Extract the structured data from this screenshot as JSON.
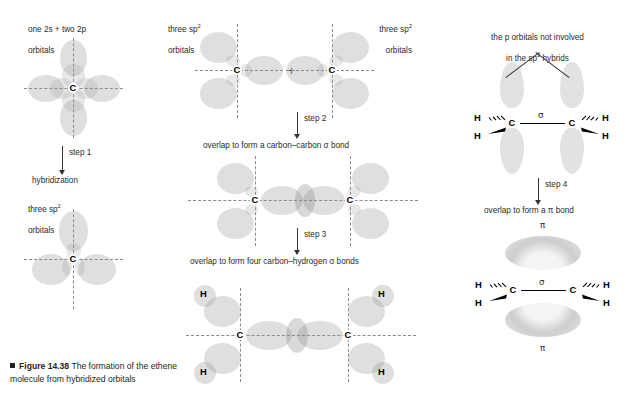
{
  "figure": {
    "number": "Figure 14.38",
    "caption_rest": "The formation of the ethene molecule from hybridized orbitals",
    "caption_full": "Figure 14.38 The formation of the ethene molecule from hybridized orbitals"
  },
  "column_left": {
    "label_top_line1": "one 2s + two 2p",
    "label_top_line2": "orbitals",
    "step": {
      "name": "step 1",
      "action": "hybridization"
    },
    "label_bottom_line1": "three sp",
    "label_bottom_sup": "2",
    "label_bottom_line2": "orbitals",
    "atom_label": "C"
  },
  "column_middle": {
    "label_left_line1": "three sp",
    "label_left_sup": "2",
    "label_left_line2": "orbitals",
    "label_right_line1": "three sp",
    "label_right_sup": "2",
    "label_right_line2": "orbitals",
    "plus_sign": "+",
    "step2": {
      "name": "step 2",
      "action": "overlap to form a carbon–carbon σ bond"
    },
    "step3": {
      "name": "step 3",
      "action": "overlap to form four carbon–hydrogen σ bonds"
    },
    "atom_label_carbon": "C",
    "atom_label_hydrogen": "H"
  },
  "column_right": {
    "label_top_line1": "the p orbitals not involved",
    "label_top_line2a": "in the sp",
    "label_top_sup": "2",
    "label_top_line2b": " hybrids",
    "step4": {
      "name": "step 4",
      "action": "overlap to form a π bond"
    },
    "sigma_symbol": "σ",
    "pi_symbol_top": "π",
    "pi_symbol_bottom": "π",
    "atom_label_carbon": "C",
    "atom_label_hydrogen": "H"
  },
  "colors": {
    "orbital_fill": "#969696",
    "axis_dash": "#8a8a8a",
    "text": "#231f20",
    "bond": "#000000",
    "background": "#ffffff"
  }
}
